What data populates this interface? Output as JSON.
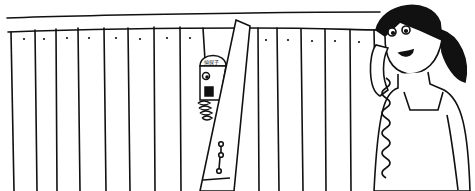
{
  "scene": {
    "description": "Cartoon line illustration: wooden fence with a peeking man and a woman talking on a phone",
    "background": "#ffffff",
    "ink": "#111111",
    "hair": "#111111"
  },
  "peeker": {
    "cap_text": "偵探子"
  }
}
